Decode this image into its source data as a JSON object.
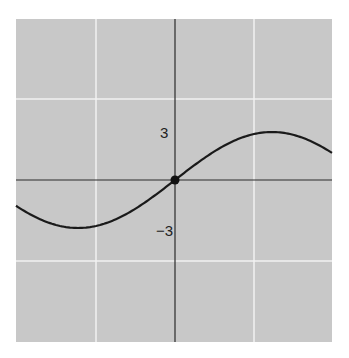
{
  "chart_data": {
    "type": "line",
    "title": "",
    "xlabel": "",
    "ylabel": "",
    "series": [
      {
        "name": "curve",
        "shape": "sine",
        "amplitude": 3,
        "passes_through": [
          0,
          0
        ],
        "max_value": 3,
        "min_value": -3,
        "color": "#1a1a1a"
      }
    ],
    "marked_points": [
      {
        "x": 0,
        "y": 0
      }
    ],
    "y_tick_labels": [
      "3",
      "−3"
    ],
    "x_tick_labels": [],
    "grid": true,
    "gridlines": {
      "vertical": 2,
      "horizontal": 2
    },
    "colors": {
      "background": "#c8c8c8",
      "grid": "#f2f2f2",
      "axis": "#2a2a2a"
    }
  },
  "labels": {
    "y_pos": "3",
    "y_neg": "−3"
  }
}
